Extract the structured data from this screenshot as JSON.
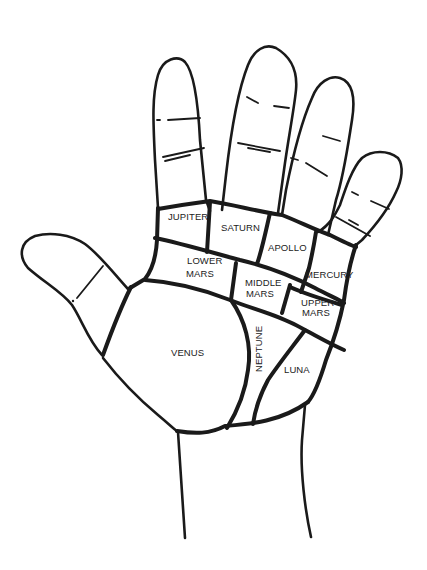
{
  "diagram": {
    "colors": {
      "background": "#ffffff",
      "line": "#1a1a1a",
      "text": "#222222"
    },
    "regions": [
      {
        "id": "jupiter",
        "label": "JUPITER"
      },
      {
        "id": "saturn",
        "label": "SATURN"
      },
      {
        "id": "apollo",
        "label": "APOLLO"
      },
      {
        "id": "lower-mars",
        "line1": "LOWER",
        "line2": "MARS"
      },
      {
        "id": "middle-mars",
        "line1": "MIDDLE",
        "line2": "MARS"
      },
      {
        "id": "mercury",
        "label": "MERCURY"
      },
      {
        "id": "upper-mars",
        "line1": "UPPER",
        "line2": "MARS"
      },
      {
        "id": "venus",
        "label": "VENUS"
      },
      {
        "id": "neptune",
        "label": "NEPTUNE"
      },
      {
        "id": "luna",
        "label": "LUNA"
      }
    ]
  }
}
